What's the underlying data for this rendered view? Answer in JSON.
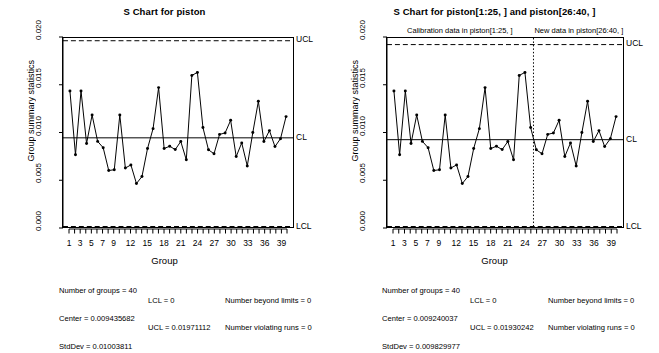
{
  "charts": [
    {
      "id": "s-chart-piston",
      "title": "S Chart for piston",
      "xlabel": "Group",
      "ylabel": "Group summary statistics",
      "labels": {
        "ucl": "UCL",
        "cl": "CL",
        "lcl": "LCL"
      },
      "stats": {
        "num_groups": "Number of groups = 40",
        "center": "Center = 0.009435682",
        "stddev": "StdDev = 0.01003811",
        "lcl": "LCL = 0",
        "ucl": "UCL = 0.01971112",
        "beyond": "Number beyond limits = 0",
        "runs": "Number violating runs = 0"
      },
      "chart_data": {
        "type": "line",
        "title": "S Chart for piston",
        "xlabel": "Group",
        "ylabel": "Group summary statistics",
        "ylim": [
          0.0,
          0.02
        ],
        "xlim": [
          1,
          40
        ],
        "yticks": [
          0.0,
          0.005,
          0.01,
          0.015,
          0.02
        ],
        "ytick_labels": [
          "0.000",
          "0.005",
          "0.010",
          "0.015",
          "0.020"
        ],
        "xticks": [
          1,
          3,
          5,
          7,
          9,
          12,
          15,
          18,
          21,
          24,
          27,
          30,
          33,
          36,
          39
        ],
        "xtick_labels": [
          "1",
          "3",
          "5",
          "7",
          "9",
          "12",
          "15",
          "18",
          "21",
          "24",
          "27",
          "30",
          "33",
          "36",
          "39"
        ],
        "grid": false,
        "legend": false,
        "center_line": 0.009435682,
        "ucl": 0.01971112,
        "lcl": 0.0,
        "x": [
          1,
          2,
          3,
          4,
          5,
          6,
          7,
          8,
          9,
          10,
          11,
          12,
          13,
          14,
          15,
          16,
          17,
          18,
          19,
          20,
          21,
          22,
          23,
          24,
          25,
          26,
          27,
          28,
          29,
          30,
          31,
          32,
          33,
          34,
          35,
          36,
          37,
          38,
          39,
          40
        ],
        "values": [
          0.01438,
          0.00765,
          0.0144,
          0.00884,
          0.01185,
          0.00906,
          0.00839,
          0.00598,
          0.00606,
          0.01185,
          0.00624,
          0.00657,
          0.0046,
          0.00534,
          0.0083,
          0.01041,
          0.01475,
          0.0083,
          0.00855,
          0.00819,
          0.00905,
          0.00711,
          0.01604,
          0.01636,
          0.01053,
          0.00817,
          0.00775,
          0.0098,
          0.00995,
          0.01129,
          0.00745,
          0.0089,
          0.00646,
          0.00999,
          0.0133,
          0.00904,
          0.0102,
          0.00851,
          0.00935,
          0.01168
        ]
      }
    },
    {
      "id": "s-chart-piston-phases",
      "title": "S Chart for piston[1:25, ] and piston[26:40, ]",
      "xlabel": "Group",
      "ylabel": "Group summary statistics",
      "labels": {
        "ucl": "UCL",
        "cl": "CL",
        "lcl": "LCL"
      },
      "stage_labels": [
        "Calibration data in piston[1:25, ]",
        "New data in piston[26:40, ]"
      ],
      "stats": {
        "num_groups": "Number of groups = 40",
        "center": "Center = 0.009240037",
        "stddev": "StdDev = 0.009829977",
        "lcl": "LCL = 0",
        "ucl": "UCL = 0.01930242",
        "beyond": "Number beyond limits = 0",
        "runs": "Number violating runs = 0"
      },
      "chart_data": {
        "type": "line",
        "title": "S Chart for piston[1:25, ] and piston[26:40, ]",
        "xlabel": "Group",
        "ylabel": "Group summary statistics",
        "ylim": [
          0.0,
          0.02
        ],
        "xlim": [
          1,
          40
        ],
        "yticks": [
          0.0,
          0.005,
          0.01,
          0.015,
          0.02
        ],
        "ytick_labels": [
          "0.000",
          "0.005",
          "0.010",
          "0.015",
          "0.020"
        ],
        "xticks": [
          1,
          3,
          5,
          7,
          9,
          12,
          15,
          18,
          21,
          24,
          27,
          30,
          33,
          36,
          39
        ],
        "xtick_labels": [
          "1",
          "3",
          "5",
          "7",
          "9",
          "12",
          "15",
          "18",
          "21",
          "24",
          "27",
          "30",
          "33",
          "36",
          "39"
        ],
        "grid": false,
        "legend": false,
        "center_line": 0.009240037,
        "ucl": 0.01930242,
        "lcl": 0.0,
        "phase_split_x": 25.5,
        "x": [
          1,
          2,
          3,
          4,
          5,
          6,
          7,
          8,
          9,
          10,
          11,
          12,
          13,
          14,
          15,
          16,
          17,
          18,
          19,
          20,
          21,
          22,
          23,
          24,
          25,
          26,
          27,
          28,
          29,
          30,
          31,
          32,
          33,
          34,
          35,
          36,
          37,
          38,
          39,
          40
        ],
        "values": [
          0.01438,
          0.00765,
          0.0144,
          0.00884,
          0.01185,
          0.00906,
          0.00839,
          0.00598,
          0.00606,
          0.01185,
          0.00624,
          0.00657,
          0.0046,
          0.00534,
          0.0083,
          0.01041,
          0.01475,
          0.0083,
          0.00855,
          0.00819,
          0.00905,
          0.00711,
          0.01604,
          0.01636,
          0.01053,
          0.00817,
          0.00775,
          0.0098,
          0.00995,
          0.01129,
          0.00745,
          0.0089,
          0.00646,
          0.00999,
          0.0133,
          0.00904,
          0.0102,
          0.00851,
          0.00935,
          0.01168
        ]
      }
    }
  ],
  "colors": {
    "line": "#000000",
    "point": "#000000",
    "limit": "#000000",
    "background": "#ffffff"
  }
}
